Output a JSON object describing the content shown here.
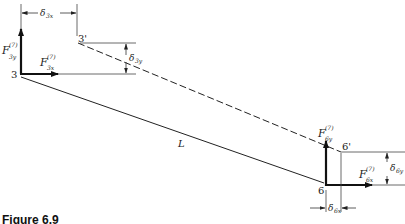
{
  "figure": {
    "caption": "Figure 6.9",
    "nodes": {
      "n3": "3",
      "n3p": "3'",
      "n6": "6",
      "n6p": "6'"
    },
    "element_length_label": "L",
    "forces": {
      "F3y": {
        "symbol": "F",
        "superscript": "(7)",
        "subscript": "3y"
      },
      "F3x": {
        "symbol": "F",
        "superscript": "(7)",
        "subscript": "3x"
      },
      "F6y": {
        "symbol": "F",
        "superscript": "(7)",
        "subscript": "6y"
      },
      "F6x": {
        "symbol": "F",
        "superscript": "(7)",
        "subscript": "6x"
      }
    },
    "displacements": {
      "d3x": {
        "symbol": "δ",
        "subscript": "3x"
      },
      "d3y": {
        "symbol": "δ",
        "subscript": "3y"
      },
      "d6x": {
        "symbol": "δ",
        "subscript": "6x"
      },
      "d6y": {
        "symbol": "δ",
        "subscript": "6y"
      }
    },
    "colors": {
      "line": "#222222",
      "force": "#111111"
    }
  }
}
